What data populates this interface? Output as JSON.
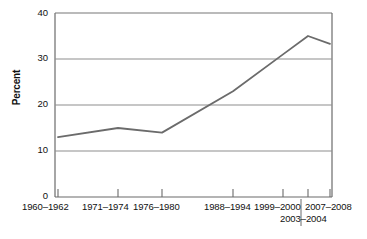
{
  "chart_data": {
    "type": "line",
    "title": "",
    "subtitle": "",
    "xlabel": "",
    "ylabel": "Percent",
    "categories": [
      "1960–1962",
      "1971–1974",
      "1976–1980",
      "1988–1994",
      "1999–2000",
      "2003–2004",
      "2007–2008"
    ],
    "values": [
      13,
      15,
      14,
      23,
      31,
      35,
      33.3
    ],
    "series": [
      {
        "name": "Percent",
        "values": [
          13,
          15,
          14,
          23,
          31,
          35,
          33.3
        ]
      }
    ],
    "ylim": [
      0,
      40
    ],
    "y_ticks": [
      0,
      10,
      20,
      30,
      40
    ],
    "y_tick_labels": [
      "0",
      "10",
      "20",
      "30",
      "40"
    ],
    "grid": true,
    "grid_axis": "y",
    "legend": false,
    "legend_position": "none",
    "annotations": [],
    "line_color": "#6b6b6b",
    "grid_color": "#999999",
    "axis_color": "#6b6b6b",
    "background": "#ffffff"
  },
  "axes": {
    "y_title": "Percent",
    "y_labels": [
      "40",
      "30",
      "20",
      "10",
      "0"
    ],
    "x_labels_row1": [
      "1960–1962",
      "1971–1974",
      "1976–1980",
      "1988–1994",
      "1999–2000",
      "2007–2008"
    ],
    "x_labels_row2": [
      "2003–2004"
    ]
  }
}
